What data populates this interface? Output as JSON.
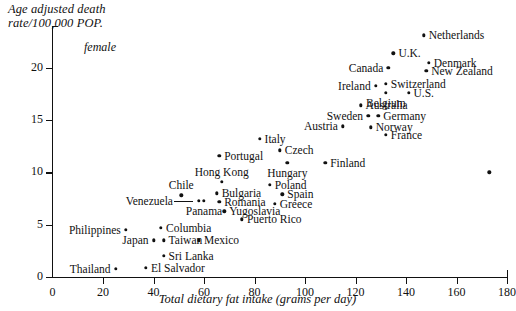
{
  "chart_data": {
    "type": "scatter",
    "title": "",
    "ylabel": "Age adjusted death rate/100,000 POP.",
    "ylabel_line1": "Age adjusted death",
    "ylabel_line2": "rate/100,000 POP.",
    "xlabel": "Total dietary fat intake (grams per day)",
    "annotation": "female",
    "xlim": [
      0,
      180
    ],
    "ylim": [
      0,
      24
    ],
    "xticks": [
      0,
      20,
      40,
      60,
      80,
      100,
      120,
      140,
      160,
      180
    ],
    "yticks": [
      0,
      5,
      10,
      15,
      20
    ],
    "grid": false,
    "legend": "none",
    "points": [
      {
        "label": "Netherlands",
        "x": 147,
        "y": 23.1,
        "lp": "right"
      },
      {
        "label": "U.K.",
        "x": 135,
        "y": 21.4,
        "lp": "right"
      },
      {
        "label": "Denmark",
        "x": 149,
        "y": 20.5,
        "lp": "right"
      },
      {
        "label": "Canada",
        "x": 133,
        "y": 20.0,
        "lp": "left"
      },
      {
        "label": "New Zealand",
        "x": 148,
        "y": 19.7,
        "lp": "right"
      },
      {
        "label": "Switzerland",
        "x": 132,
        "y": 18.5,
        "lp": "right"
      },
      {
        "label": "Ireland",
        "x": 128,
        "y": 18.3,
        "lp": "left"
      },
      {
        "label": "Belgium",
        "x": 132,
        "y": 17.6,
        "lp": "below"
      },
      {
        "label": "U.S.",
        "x": 141,
        "y": 17.6,
        "lp": "right"
      },
      {
        "label": "Australia",
        "x": 122,
        "y": 16.4,
        "lp": "right"
      },
      {
        "label": "Germany",
        "x": 129,
        "y": 15.4,
        "lp": "right"
      },
      {
        "label": "Sweden",
        "x": 125,
        "y": 15.4,
        "lp": "left"
      },
      {
        "label": "Norway",
        "x": 126,
        "y": 14.3,
        "lp": "right"
      },
      {
        "label": "Austria",
        "x": 115,
        "y": 14.4,
        "lp": "left"
      },
      {
        "label": "France",
        "x": 132,
        "y": 13.6,
        "lp": "right"
      },
      {
        "label": "Italy",
        "x": 82,
        "y": 13.2,
        "lp": "right"
      },
      {
        "label": "Czech",
        "x": 90,
        "y": 12.1,
        "lp": "right"
      },
      {
        "label": "Finland",
        "x": 108,
        "y": 10.9,
        "lp": "right"
      },
      {
        "label": "Hungary",
        "x": 93,
        "y": 10.9,
        "lp": "below"
      },
      {
        "label": "Portugal",
        "x": 66,
        "y": 11.6,
        "lp": "right"
      },
      {
        "label": "Poland",
        "x": 86,
        "y": 8.8,
        "lp": "right"
      },
      {
        "label": "Hong Kong",
        "x": 67,
        "y": 9.1,
        "lp": "above"
      },
      {
        "label": "Spain",
        "x": 91,
        "y": 7.9,
        "lp": "right"
      },
      {
        "label": "Greece",
        "x": 88,
        "y": 7.0,
        "lp": "right"
      },
      {
        "label": "Bulgaria",
        "x": 65,
        "y": 8.0,
        "lp": "right"
      },
      {
        "label": "Romania",
        "x": 66,
        "y": 7.2,
        "lp": "right"
      },
      {
        "label": "Chile",
        "x": 51,
        "y": 7.8,
        "lp": "above"
      },
      {
        "label": "Venezuela",
        "x": 58,
        "y": 7.3,
        "lp": "leader"
      },
      {
        "label": "Panama",
        "x": 60,
        "y": 7.3,
        "lp": "below"
      },
      {
        "label": "Yugoslavia",
        "x": 68,
        "y": 6.3,
        "lp": "right"
      },
      {
        "label": "Puerto Rico",
        "x": 75,
        "y": 5.5,
        "lp": "right"
      },
      {
        "label": "Columbia",
        "x": 43,
        "y": 4.7,
        "lp": "right"
      },
      {
        "label": "Philippines",
        "x": 29,
        "y": 4.5,
        "lp": "left"
      },
      {
        "label": "Mexico",
        "x": 58,
        "y": 3.5,
        "lp": "right"
      },
      {
        "label": "Taiwan",
        "x": 44,
        "y": 3.5,
        "lp": "right"
      },
      {
        "label": "Japan",
        "x": 40,
        "y": 3.5,
        "lp": "left"
      },
      {
        "label": "Sri Lanka",
        "x": 44,
        "y": 2.0,
        "lp": "right"
      },
      {
        "label": "El Salvador",
        "x": 37,
        "y": 0.9,
        "lp": "right"
      },
      {
        "label": "Thailand",
        "x": 25,
        "y": 0.8,
        "lp": "left"
      },
      {
        "label": "",
        "x": 173,
        "y": 10.0,
        "lp": "none"
      }
    ]
  }
}
